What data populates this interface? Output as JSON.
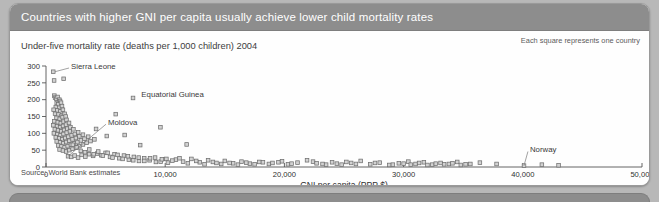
{
  "panel": {
    "title": "Countries with higher GNI per capita usually achieve lower child mortality rates",
    "subtitle": "Under-five mortality rate (deaths per 1,000 children) 2004",
    "legend_note": "Each square represents one country",
    "source": "Source: World Bank estimates"
  },
  "chart_data": {
    "type": "scatter",
    "title": "Countries with higher GNI per capita usually achieve lower child mortality rates",
    "subtitle": "Under-five mortality rate (deaths per 1,000 children) 2004",
    "xlabel": "GNI per capita (PPP $)",
    "ylabel": "Under-five mortality rate (deaths per 1,000 children) 2004",
    "xlim": [
      0,
      50000
    ],
    "ylim": [
      0,
      300
    ],
    "xticks": [
      0,
      10000,
      20000,
      30000,
      40000,
      50000
    ],
    "xticklabels": [
      "0",
      "10,000",
      "20,000",
      "30,000",
      "40,000",
      "50,000"
    ],
    "yticks": [
      0,
      50,
      100,
      150,
      200,
      250,
      300
    ],
    "yticklabels": [
      "0",
      "50",
      "100",
      "150",
      "200",
      "250",
      "300"
    ],
    "grid": false,
    "legend": "Each square represents one country",
    "marker": "square",
    "marker_fill": "#d2d2d2",
    "marker_edge": "#6f6f6f",
    "annotations": [
      {
        "text": "Sierra Leone",
        "x": 750,
        "y": 283,
        "label_x": 2100,
        "label_y": 300,
        "leader": true
      },
      {
        "text": "Equatorial Guinea",
        "x": 7300,
        "y": 205,
        "label_x": 8000,
        "label_y": 218,
        "leader": false
      },
      {
        "text": "Moldova",
        "x": 1850,
        "y": 32,
        "label_x": 5200,
        "label_y": 133,
        "leader": true
      },
      {
        "text": "Norway",
        "x": 40100,
        "y": 4,
        "label_x": 40600,
        "label_y": 52,
        "leader": true
      }
    ],
    "points": [
      [
        610,
        283
      ],
      [
        680,
        257
      ],
      [
        1480,
        262
      ],
      [
        700,
        212
      ],
      [
        760,
        206
      ],
      [
        860,
        203
      ],
      [
        980,
        208
      ],
      [
        1120,
        200
      ],
      [
        1180,
        196
      ],
      [
        900,
        190
      ],
      [
        1020,
        186
      ],
      [
        1260,
        191
      ],
      [
        820,
        178
      ],
      [
        1100,
        176
      ],
      [
        1340,
        181
      ],
      [
        640,
        170
      ],
      [
        950,
        168
      ],
      [
        1210,
        165
      ],
      [
        1420,
        170
      ],
      [
        760,
        158
      ],
      [
        1050,
        156
      ],
      [
        1300,
        152
      ],
      [
        1560,
        158
      ],
      [
        880,
        146
      ],
      [
        1150,
        143
      ],
      [
        1390,
        148
      ],
      [
        1650,
        150
      ],
      [
        700,
        136
      ],
      [
        990,
        133
      ],
      [
        1240,
        130
      ],
      [
        1480,
        135
      ],
      [
        1720,
        140
      ],
      [
        620,
        124
      ],
      [
        930,
        121
      ],
      [
        1180,
        118
      ],
      [
        1430,
        122
      ],
      [
        1680,
        126
      ],
      [
        1930,
        131
      ],
      [
        740,
        112
      ],
      [
        1010,
        109
      ],
      [
        1270,
        106
      ],
      [
        1520,
        110
      ],
      [
        1790,
        114
      ],
      [
        2050,
        118
      ],
      [
        660,
        100
      ],
      [
        960,
        97
      ],
      [
        1220,
        94
      ],
      [
        1470,
        98
      ],
      [
        1740,
        102
      ],
      [
        2010,
        106
      ],
      [
        2300,
        112
      ],
      [
        820,
        88
      ],
      [
        1100,
        85
      ],
      [
        1360,
        82
      ],
      [
        1620,
        86
      ],
      [
        1880,
        90
      ],
      [
        2150,
        94
      ],
      [
        2420,
        98
      ],
      [
        2700,
        103
      ],
      [
        900,
        76
      ],
      [
        1180,
        73
      ],
      [
        1440,
        70
      ],
      [
        1700,
        74
      ],
      [
        1960,
        78
      ],
      [
        2230,
        82
      ],
      [
        2510,
        86
      ],
      [
        2800,
        91
      ],
      [
        3100,
        96
      ],
      [
        1020,
        64
      ],
      [
        1300,
        61
      ],
      [
        1560,
        58
      ],
      [
        1820,
        62
      ],
      [
        2090,
        66
      ],
      [
        2360,
        70
      ],
      [
        2640,
        74
      ],
      [
        2930,
        79
      ],
      [
        3230,
        84
      ],
      [
        3540,
        90
      ],
      [
        1140,
        52
      ],
      [
        1420,
        49
      ],
      [
        1690,
        46
      ],
      [
        1960,
        50
      ],
      [
        2230,
        54
      ],
      [
        2510,
        58
      ],
      [
        2800,
        62
      ],
      [
        3100,
        67
      ],
      [
        3410,
        72
      ],
      [
        3730,
        77
      ],
      [
        4060,
        82
      ],
      [
        1850,
        32
      ],
      [
        2120,
        30
      ],
      [
        2400,
        34
      ],
      [
        2690,
        28
      ],
      [
        2990,
        36
      ],
      [
        3300,
        31
      ],
      [
        3620,
        38
      ],
      [
        3950,
        33
      ],
      [
        4290,
        40
      ],
      [
        4640,
        35
      ],
      [
        5000,
        42
      ],
      [
        5370,
        30
      ],
      [
        5750,
        38
      ],
      [
        6140,
        26
      ],
      [
        6540,
        34
      ],
      [
        6950,
        22
      ],
      [
        7370,
        30
      ],
      [
        7800,
        18
      ],
      [
        8240,
        26
      ],
      [
        8690,
        20
      ],
      [
        9150,
        28
      ],
      [
        9620,
        16
      ],
      [
        10100,
        24
      ],
      [
        2250,
        66
      ],
      [
        2580,
        58
      ],
      [
        2920,
        48
      ],
      [
        3270,
        44
      ],
      [
        3630,
        52
      ],
      [
        4000,
        38
      ],
      [
        4380,
        46
      ],
      [
        4770,
        34
      ],
      [
        5170,
        42
      ],
      [
        5580,
        28
      ],
      [
        6000,
        36
      ],
      [
        6430,
        24
      ],
      [
        6870,
        32
      ],
      [
        7320,
        20
      ],
      [
        7780,
        28
      ],
      [
        8250,
        18
      ],
      [
        8730,
        26
      ],
      [
        9220,
        15
      ],
      [
        9720,
        23
      ],
      [
        10230,
        13
      ],
      [
        4200,
        113
      ],
      [
        5100,
        92
      ],
      [
        5850,
        157
      ],
      [
        6600,
        95
      ],
      [
        7300,
        205
      ],
      [
        7900,
        65
      ],
      [
        9600,
        118
      ],
      [
        11800,
        67
      ],
      [
        10900,
        22
      ],
      [
        11500,
        16
      ],
      [
        12200,
        24
      ],
      [
        12900,
        14
      ],
      [
        13600,
        20
      ],
      [
        14300,
        12
      ],
      [
        15000,
        18
      ],
      [
        15700,
        11
      ],
      [
        16400,
        16
      ],
      [
        17100,
        10
      ],
      [
        17900,
        15
      ],
      [
        18700,
        9
      ],
      [
        19500,
        14
      ],
      [
        20300,
        8
      ],
      [
        21100,
        13
      ],
      [
        21900,
        20
      ],
      [
        22400,
        16
      ],
      [
        23200,
        9
      ],
      [
        24000,
        14
      ],
      [
        24800,
        7
      ],
      [
        25600,
        12
      ],
      [
        26400,
        18
      ],
      [
        27200,
        8
      ],
      [
        28000,
        13
      ],
      [
        28800,
        6
      ],
      [
        29600,
        11
      ],
      [
        30400,
        16
      ],
      [
        31000,
        9
      ],
      [
        31700,
        14
      ],
      [
        32400,
        7
      ],
      [
        33100,
        12
      ],
      [
        33800,
        9
      ],
      [
        34500,
        15
      ],
      [
        35200,
        8
      ],
      [
        30000,
        10
      ],
      [
        30600,
        7
      ],
      [
        31300,
        12
      ],
      [
        32000,
        6
      ],
      [
        32700,
        10
      ],
      [
        33400,
        8
      ],
      [
        34100,
        11
      ],
      [
        34800,
        6
      ],
      [
        35600,
        9
      ],
      [
        36400,
        13
      ],
      [
        37800,
        9
      ],
      [
        40100,
        4
      ],
      [
        41600,
        7
      ],
      [
        43000,
        5
      ],
      [
        19000,
        12
      ],
      [
        19800,
        17
      ],
      [
        20600,
        10
      ],
      [
        18200,
        14
      ],
      [
        17500,
        8
      ],
      [
        16800,
        13
      ],
      [
        16100,
        7
      ],
      [
        15400,
        12
      ],
      [
        14700,
        9
      ],
      [
        14000,
        15
      ],
      [
        13300,
        8
      ],
      [
        12600,
        18
      ],
      [
        11900,
        11
      ],
      [
        11200,
        26
      ],
      [
        10600,
        19
      ],
      [
        22700,
        11
      ],
      [
        23500,
        7
      ],
      [
        26000,
        9
      ],
      [
        27600,
        12
      ],
      [
        29100,
        7
      ],
      [
        25200,
        15
      ],
      [
        24400,
        10
      ]
    ]
  }
}
